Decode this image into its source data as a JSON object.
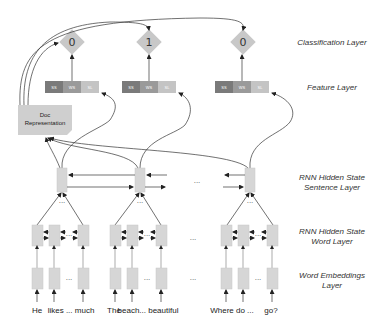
{
  "layers": {
    "classification": "Classification Layer",
    "feature": "Feature Layer",
    "sentence_rnn_line1": "RNN Hidden State",
    "sentence_rnn_line2": "Sentence Layer",
    "word_rnn_line1": "RNN Hidden State",
    "word_rnn_line2": "Word Layer",
    "embeddings_line1": "Word Embeddings",
    "embeddings_line2": "Layer"
  },
  "outputs": [
    "0",
    "1",
    "0"
  ],
  "feature_segments": [
    "SS",
    "WS",
    "SL"
  ],
  "doc_representation": {
    "line1": "Doc",
    "line2": "Representation"
  },
  "sentences": [
    {
      "words": [
        "He",
        "likes ... much"
      ]
    },
    {
      "words": [
        "The",
        "beach... beautiful"
      ]
    },
    {
      "words": [
        "Where do ...",
        "go?"
      ]
    }
  ],
  "ellipsis": "...",
  "colors": {
    "diamond": "#c8c8c8",
    "feature_ss": "#7a7a7a",
    "feature_ws": "#9a9a9a",
    "feature_sl": "#c4c4c4",
    "box": "#d6d6d6",
    "doc_box": "#cfcfcf"
  }
}
